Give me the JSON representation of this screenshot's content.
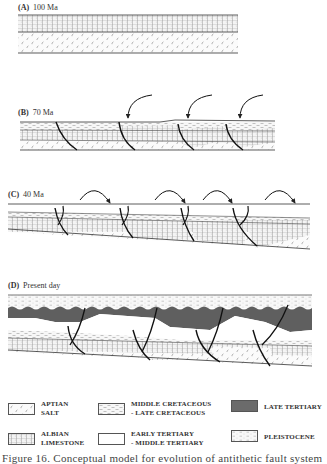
{
  "figure": {
    "panels": [
      {
        "id": "A",
        "letter": "(A)",
        "age": "100 Ma"
      },
      {
        "id": "B",
        "letter": "(B)",
        "age": "70 Ma"
      },
      {
        "id": "C",
        "letter": "(C)",
        "age": "40 Ma"
      },
      {
        "id": "D",
        "letter": "(D)",
        "age": "Present day"
      }
    ],
    "legend": [
      {
        "key": "aptian_salt",
        "line1": "APTIAN",
        "line2": "SALT",
        "pattern": "salt-checks"
      },
      {
        "key": "middle_late_cretaceous",
        "line1": "MIDDLE CRETACEOUS",
        "line2": "- LATE CRETACEOUS",
        "pattern": "dashes"
      },
      {
        "key": "late_tertiary",
        "line1": "LATE TERTIARY",
        "line2": "",
        "pattern": "solid-dark",
        "color": "#6b6b6b"
      },
      {
        "key": "albian_limestone",
        "line1": "ALBIAN",
        "line2": "LIMESTONE",
        "pattern": "brick-grid"
      },
      {
        "key": "early_middle_tertiary",
        "line1": "EARLY TERTIARY",
        "line2": "- MIDDLE TERTIARY",
        "pattern": "blank"
      },
      {
        "key": "pleistocene",
        "line1": "PLEISTOCENE",
        "line2": "",
        "pattern": "dots-dashes"
      }
    ],
    "caption": "Figure 16. Conceptual model for evolution of antithetic fault system"
  }
}
